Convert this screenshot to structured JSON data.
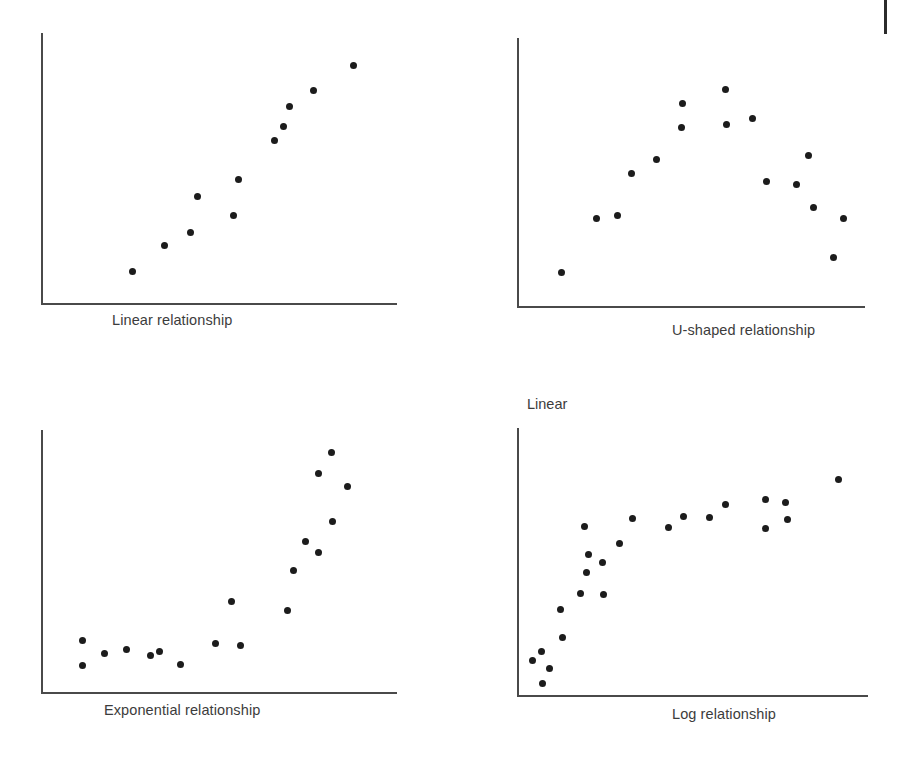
{
  "figure": {
    "title": "",
    "background_color": "#ffffff",
    "axis_color": "#4a4a4a",
    "point_color": "#1c1c1c",
    "text_color": "#3c3c3c",
    "corner_mark": "page-rule-mark"
  },
  "panels": [
    {
      "id": "linear",
      "caption": "Linear relationship",
      "axis_label_top": "",
      "origin": {
        "x": 41,
        "y": 303
      },
      "axis": {
        "x_end": 397,
        "y_top": 33
      },
      "caption_pos": {
        "x": 112,
        "y": 312
      }
    },
    {
      "id": "u-shaped",
      "caption": "U-shaped relationship",
      "axis_label_top": "",
      "origin": {
        "x": 517,
        "y": 306
      },
      "axis": {
        "x_end": 865,
        "y_top": 38
      },
      "caption_pos": {
        "x": 672,
        "y": 322
      }
    },
    {
      "id": "exponential",
      "caption": "Exponential relationship",
      "axis_label_top": "",
      "origin": {
        "x": 41,
        "y": 692
      },
      "axis": {
        "x_end": 397,
        "y_top": 430
      },
      "caption_pos": {
        "x": 104,
        "y": 702
      }
    },
    {
      "id": "log",
      "caption": "Log relationship",
      "axis_label_top": "Linear",
      "origin": {
        "x": 517,
        "y": 695
      },
      "axis": {
        "x_end": 868,
        "y_top": 428
      },
      "caption_pos": {
        "x": 672,
        "y": 706
      },
      "axis_label_top_pos": {
        "x": 527,
        "y": 396
      }
    }
  ],
  "chart_data": [
    {
      "type": "scatter",
      "id": "linear",
      "title": "Linear relationship",
      "xlabel": "",
      "ylabel": "",
      "grid": false,
      "legend": false,
      "axis_ranges": {
        "x": [
          0,
          1
        ],
        "y": [
          0,
          1
        ]
      },
      "points": [
        {
          "x": 132,
          "y": 271
        },
        {
          "x": 164,
          "y": 245
        },
        {
          "x": 190,
          "y": 232
        },
        {
          "x": 197,
          "y": 196
        },
        {
          "x": 233,
          "y": 215
        },
        {
          "x": 238,
          "y": 179
        },
        {
          "x": 274,
          "y": 140
        },
        {
          "x": 283,
          "y": 126
        },
        {
          "x": 289,
          "y": 106
        },
        {
          "x": 313,
          "y": 90
        },
        {
          "x": 353,
          "y": 65
        }
      ]
    },
    {
      "type": "scatter",
      "id": "u-shaped",
      "title": "U-shaped relationship",
      "xlabel": "",
      "ylabel": "",
      "grid": false,
      "legend": false,
      "axis_ranges": {
        "x": [
          0,
          1
        ],
        "y": [
          0,
          1
        ]
      },
      "points": [
        {
          "x": 561,
          "y": 272
        },
        {
          "x": 596,
          "y": 218
        },
        {
          "x": 617,
          "y": 215
        },
        {
          "x": 631,
          "y": 173
        },
        {
          "x": 656,
          "y": 159
        },
        {
          "x": 681,
          "y": 127
        },
        {
          "x": 682,
          "y": 103
        },
        {
          "x": 725,
          "y": 89
        },
        {
          "x": 726,
          "y": 124
        },
        {
          "x": 752,
          "y": 118
        },
        {
          "x": 766,
          "y": 181
        },
        {
          "x": 796,
          "y": 184
        },
        {
          "x": 808,
          "y": 155
        },
        {
          "x": 813,
          "y": 207
        },
        {
          "x": 833,
          "y": 257
        },
        {
          "x": 843,
          "y": 218
        }
      ]
    },
    {
      "type": "scatter",
      "id": "exponential",
      "title": "Exponential relationship",
      "xlabel": "",
      "ylabel": "",
      "grid": false,
      "legend": false,
      "axis_ranges": {
        "x": [
          0,
          1
        ],
        "y": [
          0,
          1
        ]
      },
      "points": [
        {
          "x": 82,
          "y": 640
        },
        {
          "x": 82,
          "y": 665
        },
        {
          "x": 104,
          "y": 653
        },
        {
          "x": 126,
          "y": 649
        },
        {
          "x": 150,
          "y": 655
        },
        {
          "x": 159,
          "y": 651
        },
        {
          "x": 180,
          "y": 664
        },
        {
          "x": 215,
          "y": 643
        },
        {
          "x": 240,
          "y": 645
        },
        {
          "x": 231,
          "y": 601
        },
        {
          "x": 287,
          "y": 610
        },
        {
          "x": 293,
          "y": 570
        },
        {
          "x": 305,
          "y": 541
        },
        {
          "x": 318,
          "y": 552
        },
        {
          "x": 332,
          "y": 521
        },
        {
          "x": 347,
          "y": 486
        },
        {
          "x": 318,
          "y": 473
        },
        {
          "x": 331,
          "y": 452
        }
      ]
    },
    {
      "type": "scatter",
      "id": "log",
      "title": "Log relationship",
      "xlabel": "",
      "ylabel": "Linear",
      "grid": false,
      "legend": false,
      "axis_ranges": {
        "x": [
          0,
          1
        ],
        "y": [
          0,
          1
        ]
      },
      "points": [
        {
          "x": 532,
          "y": 660
        },
        {
          "x": 541,
          "y": 651
        },
        {
          "x": 549,
          "y": 668
        },
        {
          "x": 542,
          "y": 683
        },
        {
          "x": 562,
          "y": 637
        },
        {
          "x": 560,
          "y": 609
        },
        {
          "x": 580,
          "y": 593
        },
        {
          "x": 586,
          "y": 572
        },
        {
          "x": 588,
          "y": 554
        },
        {
          "x": 584,
          "y": 526
        },
        {
          "x": 602,
          "y": 562
        },
        {
          "x": 603,
          "y": 594
        },
        {
          "x": 619,
          "y": 543
        },
        {
          "x": 632,
          "y": 518
        },
        {
          "x": 668,
          "y": 527
        },
        {
          "x": 683,
          "y": 516
        },
        {
          "x": 709,
          "y": 517
        },
        {
          "x": 725,
          "y": 504
        },
        {
          "x": 765,
          "y": 499
        },
        {
          "x": 765,
          "y": 528
        },
        {
          "x": 785,
          "y": 502
        },
        {
          "x": 787,
          "y": 519
        },
        {
          "x": 838,
          "y": 479
        }
      ]
    }
  ]
}
